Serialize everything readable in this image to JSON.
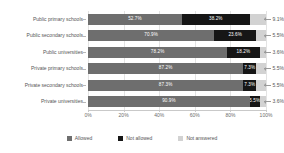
{
  "chart_data": {
    "type": "bar",
    "orientation": "horizontal",
    "stacked": true,
    "stacked_percent": true,
    "title": "",
    "xlabel": "",
    "ylabel": "",
    "xlim": [
      0,
      100
    ],
    "grid": true,
    "legend_position": "bottom",
    "categories": [
      "Public primary schools",
      "Public secondary schools",
      "Public universities",
      "Private primary schools",
      "Private secondary schools",
      "Private universities"
    ],
    "series": [
      {
        "name": "Allowed",
        "color": "#6e6e6e",
        "values": [
          52.7,
          70.9,
          78.2,
          87.2,
          87.3,
          90.9
        ],
        "labels": [
          "52.7%",
          "70.9%",
          "78.2%",
          "87.2%",
          "87.3%",
          "90.9%"
        ]
      },
      {
        "name": "Not allowed",
        "color": "#161616",
        "values": [
          38.2,
          23.6,
          18.2,
          7.3,
          7.3,
          5.5
        ],
        "labels": [
          "38.2%",
          "23.6%",
          "18.2%",
          "7.3%",
          "7.3%",
          "5.5%"
        ]
      },
      {
        "name": "Not answered",
        "color": "#d2d2d2",
        "values": [
          9.1,
          5.5,
          3.6,
          5.5,
          5.5,
          3.6
        ],
        "labels": [
          "9.1%",
          "5.5%",
          "3.6%",
          "5.5%",
          "5.5%",
          "3.6%"
        ]
      }
    ],
    "xticks": [
      0,
      20,
      40,
      60,
      80,
      100
    ],
    "xtick_labels": [
      "0%",
      "20%",
      "40%",
      "60%",
      "80%",
      "100%"
    ],
    "callout_labels": [
      "9.1%",
      "5.5%",
      "3.6%",
      "5.5%",
      "5.5%",
      "3.6%"
    ]
  },
  "legend": {
    "items": [
      {
        "label": "Allowed",
        "color": "#6e6e6e"
      },
      {
        "label": "Not allowed",
        "color": "#161616"
      },
      {
        "label": "Not answered",
        "color": "#d2d2d2"
      }
    ]
  }
}
